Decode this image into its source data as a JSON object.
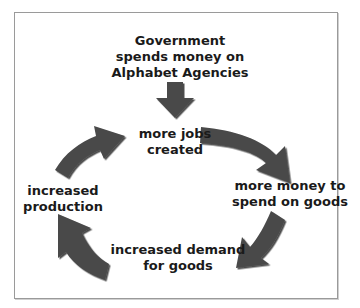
{
  "diagram": {
    "type": "cycle",
    "start": {
      "text_lines": [
        "Government",
        "spends money on",
        "Alphabet Agencies"
      ]
    },
    "nodes": [
      {
        "id": "jobs",
        "text_lines": [
          "more jobs",
          "created"
        ]
      },
      {
        "id": "money",
        "text_lines": [
          "more money to",
          "spend on goods"
        ]
      },
      {
        "id": "demand",
        "text_lines": [
          "increased demand",
          "for goods"
        ]
      },
      {
        "id": "production",
        "text_lines": [
          "increased",
          "production"
        ]
      }
    ],
    "arrow_color": "#4a4a4a",
    "edges": [
      [
        "start",
        "jobs"
      ],
      [
        "jobs",
        "money"
      ],
      [
        "money",
        "demand"
      ],
      [
        "demand",
        "production"
      ],
      [
        "production",
        "jobs"
      ]
    ]
  }
}
